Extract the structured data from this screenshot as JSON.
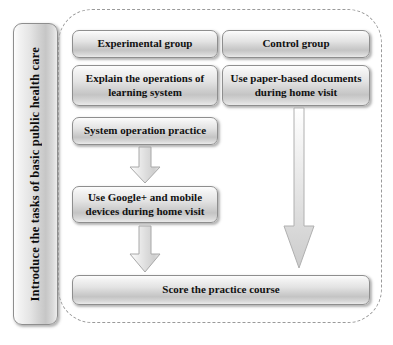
{
  "diagram": {
    "title_banner": {
      "label": "Introduce the tasks of basic public health care",
      "orientation": "vertical"
    },
    "group_container": {
      "style": "dashed-rounded-rectangle"
    },
    "columns": {
      "experimental": {
        "header": "Experimental group",
        "steps": [
          "Explain the operations of learning system",
          "System operation practice",
          "Use Google+ and mobile devices during home visit"
        ]
      },
      "control": {
        "header": "Control group",
        "steps": [
          "Use paper-based documents during home visit"
        ]
      }
    },
    "outcome": {
      "label": "Score the practice course"
    },
    "nodes": {
      "experimental_group": "Experimental group",
      "explain_operations": "Explain the operations of learning system",
      "explain_operations_line1": "Explain the operations of",
      "explain_operations_line2": "learning system",
      "system_operation_practice": "System operation practice",
      "use_google_mobile": "Use Google+ and mobile devices during home visit",
      "use_google_mobile_line1": "Use Google+ and mobile",
      "use_google_mobile_line2": "devices during home visit",
      "control_group": "Control group",
      "use_paper_documents": "Use paper-based documents during home visit",
      "use_paper_documents_line1": "Use paper-based documents",
      "use_paper_documents_line2": "during home visit",
      "score_practice_course": "Score the practice course"
    },
    "arrows": [
      {
        "name": "arrow-system-practice-to-google",
        "from": "System operation practice",
        "to": "Use Google+ and mobile devices during home visit",
        "direction": "down"
      },
      {
        "name": "arrow-google-to-score",
        "from": "Use Google+ and mobile devices during home visit",
        "to": "Score the practice course",
        "direction": "down"
      },
      {
        "name": "arrow-paper-to-score",
        "from": "Use paper-based documents during home visit",
        "to": "Score the practice course",
        "direction": "down"
      }
    ],
    "colors": {
      "box_fill_light": "#fdfdfd",
      "box_fill_mid": "#d2d2d2",
      "box_border": "#8e8e8e",
      "dashed_border": "#9a9a9a",
      "text": "#111111",
      "background": "#ffffff"
    }
  }
}
